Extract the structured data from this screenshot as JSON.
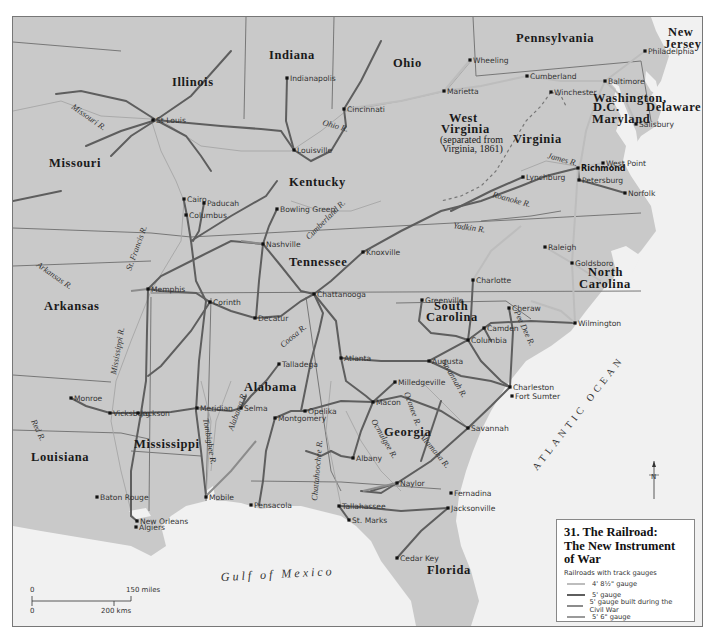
{
  "legend": {
    "title_line1": "31. The Railroad:",
    "title_line2": "The New Instrument of War",
    "subtitle": "Railroads with track gauges",
    "items": [
      {
        "label": "4' 8½\" gauge",
        "color": "#bdbdbd"
      },
      {
        "label": "5' gauge",
        "color": "#5e5e5e"
      },
      {
        "label": "5' gauge built during the Civil War",
        "color": "#8c8c8c"
      },
      {
        "label": "5' 6\" gauge",
        "color": "#9a9a9a"
      }
    ]
  },
  "colors": {
    "land": "#c9c9c9",
    "water": "#f1f1f1",
    "border": "#777777",
    "river": "#a6a6a6",
    "rail_standard": "#bdbdbd",
    "rail_5ft": "#5e5e5e",
    "rail_wartime": "#8c8c8c",
    "city_dot": "#111111"
  },
  "states": [
    {
      "name": "Illinois",
      "x": 171,
      "y": 85
    },
    {
      "name": "Indiana",
      "x": 268,
      "y": 58
    },
    {
      "name": "Ohio",
      "x": 392,
      "y": 66
    },
    {
      "name": "Pennsylvania",
      "x": 515,
      "y": 41
    },
    {
      "name": "New",
      "x": 667,
      "y": 35
    },
    {
      "name": "Jersey",
      "x": 663,
      "y": 47
    },
    {
      "name": "Missouri",
      "x": 48,
      "y": 166
    },
    {
      "name": "Kentucky",
      "x": 288,
      "y": 185
    },
    {
      "name": "West",
      "x": 448,
      "y": 121
    },
    {
      "name": "Virginia",
      "x": 440,
      "y": 132
    },
    {
      "name": "Virginia",
      "x": 512,
      "y": 142
    },
    {
      "name": "Washington,",
      "x": 592,
      "y": 101
    },
    {
      "name": "D.C.",
      "x": 592,
      "y": 110
    },
    {
      "name": "Delaware",
      "x": 645,
      "y": 110
    },
    {
      "name": "Maryland",
      "x": 591,
      "y": 122
    },
    {
      "name": "Tennessee",
      "x": 288,
      "y": 265
    },
    {
      "name": "North",
      "x": 587,
      "y": 275
    },
    {
      "name": "Carolina",
      "x": 578,
      "y": 287
    },
    {
      "name": "Arkansas",
      "x": 43,
      "y": 309
    },
    {
      "name": "South",
      "x": 433,
      "y": 309
    },
    {
      "name": "Carolina",
      "x": 425,
      "y": 320
    },
    {
      "name": "Alabama",
      "x": 243,
      "y": 390
    },
    {
      "name": "Georgia",
      "x": 383,
      "y": 435
    },
    {
      "name": "Mississippi",
      "x": 133,
      "y": 447
    },
    {
      "name": "Louisiana",
      "x": 30,
      "y": 460
    },
    {
      "name": "Florida",
      "x": 426,
      "y": 573
    }
  ],
  "state_note": {
    "line1": "(separated from",
    "line2": "Virginia, 1861)"
  },
  "cities": [
    {
      "name": "Indianapolis",
      "x": 286,
      "y": 77
    },
    {
      "name": "Cincinnati",
      "x": 343,
      "y": 108
    },
    {
      "name": "Wheeling",
      "x": 469,
      "y": 59
    },
    {
      "name": "Marietta",
      "x": 443,
      "y": 90
    },
    {
      "name": "Cumberland",
      "x": 526,
      "y": 75
    },
    {
      "name": "Philadelphia",
      "x": 644,
      "y": 50
    },
    {
      "name": "Baltimore",
      "x": 604,
      "y": 80
    },
    {
      "name": "Winchester",
      "x": 550,
      "y": 91
    },
    {
      "name": "St Louis",
      "x": 152,
      "y": 119
    },
    {
      "name": "Louisville",
      "x": 293,
      "y": 149
    },
    {
      "name": "Salisbury",
      "x": 635,
      "y": 123
    },
    {
      "name": "West Point",
      "x": 602,
      "y": 162
    },
    {
      "name": "Richmond",
      "x": 577,
      "y": 167
    },
    {
      "name": "Lynchburg",
      "x": 522,
      "y": 176
    },
    {
      "name": "Petersburg",
      "x": 578,
      "y": 179
    },
    {
      "name": "Norfolk",
      "x": 624,
      "y": 192
    },
    {
      "name": "Cairo",
      "x": 183,
      "y": 198
    },
    {
      "name": "Paducah",
      "x": 203,
      "y": 202
    },
    {
      "name": "Columbus",
      "x": 185,
      "y": 214
    },
    {
      "name": "Bowling Green",
      "x": 276,
      "y": 208
    },
    {
      "name": "Nashville",
      "x": 262,
      "y": 243
    },
    {
      "name": "Knoxville",
      "x": 362,
      "y": 251
    },
    {
      "name": "Raleigh",
      "x": 544,
      "y": 246
    },
    {
      "name": "Goldsboro",
      "x": 571,
      "y": 262
    },
    {
      "name": "Charlotte",
      "x": 472,
      "y": 279
    },
    {
      "name": "Memphis",
      "x": 147,
      "y": 288
    },
    {
      "name": "Chattanooga",
      "x": 313,
      "y": 293
    },
    {
      "name": "Corinth",
      "x": 209,
      "y": 301
    },
    {
      "name": "Decatur",
      "x": 254,
      "y": 317
    },
    {
      "name": "Greenville",
      "x": 421,
      "y": 299
    },
    {
      "name": "Cheraw",
      "x": 508,
      "y": 307
    },
    {
      "name": "Camden",
      "x": 483,
      "y": 327
    },
    {
      "name": "Wilmington",
      "x": 574,
      "y": 322
    },
    {
      "name": "Columbia",
      "x": 467,
      "y": 339
    },
    {
      "name": "Talladega",
      "x": 278,
      "y": 363
    },
    {
      "name": "Atlanta",
      "x": 340,
      "y": 357
    },
    {
      "name": "Augusta",
      "x": 428,
      "y": 360
    },
    {
      "name": "Milledgeville",
      "x": 394,
      "y": 381
    },
    {
      "name": "Charleston",
      "x": 509,
      "y": 386
    },
    {
      "name": "Fort Sumter",
      "x": 511,
      "y": 395
    },
    {
      "name": "Monroe",
      "x": 70,
      "y": 397
    },
    {
      "name": "Vicksburg",
      "x": 109,
      "y": 412
    },
    {
      "name": "Jackson",
      "x": 137,
      "y": 412
    },
    {
      "name": "Meridian",
      "x": 196,
      "y": 407
    },
    {
      "name": "Selma",
      "x": 240,
      "y": 407
    },
    {
      "name": "Opelika",
      "x": 304,
      "y": 410
    },
    {
      "name": "Montgomery",
      "x": 274,
      "y": 417
    },
    {
      "name": "Macon",
      "x": 372,
      "y": 401
    },
    {
      "name": "Savannah",
      "x": 467,
      "y": 427
    },
    {
      "name": "Albany",
      "x": 352,
      "y": 457
    },
    {
      "name": "Naylor",
      "x": 396,
      "y": 482
    },
    {
      "name": "Baton Rouge",
      "x": 96,
      "y": 496
    },
    {
      "name": "Fernadina",
      "x": 450,
      "y": 492
    },
    {
      "name": "Tallahassee",
      "x": 338,
      "y": 505
    },
    {
      "name": "Jacksonville",
      "x": 447,
      "y": 507
    },
    {
      "name": "Mobile",
      "x": 205,
      "y": 496
    },
    {
      "name": "Pensacola",
      "x": 250,
      "y": 504
    },
    {
      "name": "New Orleans",
      "x": 136,
      "y": 520
    },
    {
      "name": "St. Marks",
      "x": 348,
      "y": 519
    },
    {
      "name": "Algiers",
      "x": 135,
      "y": 526
    },
    {
      "name": "Cedar Key",
      "x": 396,
      "y": 557
    }
  ],
  "rivers": [
    {
      "name": "Missouri R.",
      "x": 70,
      "y": 107,
      "rotate": 35
    },
    {
      "name": "Ohio R.",
      "x": 321,
      "y": 124,
      "rotate": 15
    },
    {
      "name": "James R.",
      "x": 546,
      "y": 157,
      "rotate": 15
    },
    {
      "name": "Roanoke R.",
      "x": 491,
      "y": 196,
      "rotate": 15
    },
    {
      "name": "Cumberland R.",
      "x": 308,
      "y": 239,
      "rotate": -45
    },
    {
      "name": "Yadkin R.",
      "x": 452,
      "y": 227,
      "rotate": 8
    },
    {
      "name": "St. Francis R.",
      "x": 130,
      "y": 270,
      "rotate": -70
    },
    {
      "name": "Arkansas R.",
      "x": 35,
      "y": 265,
      "rotate": 35
    },
    {
      "name": "Mississippi R.",
      "x": 115,
      "y": 374,
      "rotate": -80
    },
    {
      "name": "Coosa R.",
      "x": 282,
      "y": 347,
      "rotate": -40
    },
    {
      "name": "Pee Dee R.",
      "x": 513,
      "y": 311,
      "rotate": 65
    },
    {
      "name": "Savannah R.",
      "x": 440,
      "y": 360,
      "rotate": 60
    },
    {
      "name": "Oconee R.",
      "x": 403,
      "y": 392,
      "rotate": 70
    },
    {
      "name": "Ocmulgee R.",
      "x": 370,
      "y": 420,
      "rotate": 60
    },
    {
      "name": "Altamaha R.",
      "x": 418,
      "y": 435,
      "rotate": 50
    },
    {
      "name": "Red R.",
      "x": 30,
      "y": 420,
      "rotate": 65
    },
    {
      "name": "Tombigbee R.",
      "x": 202,
      "y": 418,
      "rotate": 80
    },
    {
      "name": "Alabama R.",
      "x": 232,
      "y": 430,
      "rotate": -70
    },
    {
      "name": "Chattahoochee R.",
      "x": 316,
      "y": 500,
      "rotate": -85
    }
  ],
  "seas": {
    "gulf": "Gulf of Mexico",
    "atlantic": "ATLANTIC OCEAN"
  },
  "compass": {
    "label": "N"
  },
  "scale": {
    "miles_zero": "0",
    "miles_label": "150 miles",
    "kms_zero": "0",
    "kms_label": "200 kms"
  }
}
